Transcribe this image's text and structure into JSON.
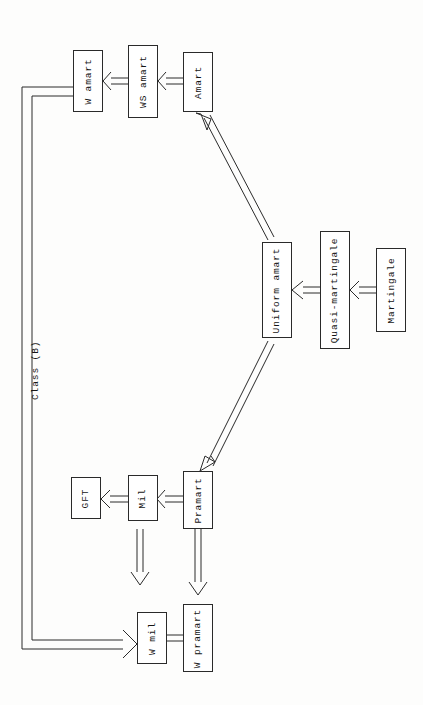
{
  "figure": {
    "orientation": "rotated-90-ccw",
    "stroke_color": "#2a2a2a",
    "background_color": "#fdfdfc"
  },
  "nodes": [
    {
      "id": "w-amart",
      "label": "W amart"
    },
    {
      "id": "ws-amart",
      "label": "WS amart"
    },
    {
      "id": "amart",
      "label": "Amart"
    },
    {
      "id": "uniform-amart",
      "label": "Uniform amart"
    },
    {
      "id": "quasi-martingale",
      "label": "Quasi-martingale"
    },
    {
      "id": "martingale",
      "label": "Martingale"
    },
    {
      "id": "gft",
      "label": "GFT"
    },
    {
      "id": "mil",
      "label": "Mil"
    },
    {
      "id": "pramart",
      "label": "Pramart"
    },
    {
      "id": "w-mil",
      "label": "W mil"
    },
    {
      "id": "w-pramart",
      "label": "W pramart"
    }
  ],
  "annotations": [
    {
      "id": "class-b",
      "label": "Class (B)"
    }
  ],
  "edges": [
    {
      "from": "ws-amart",
      "to": "w-amart"
    },
    {
      "from": "amart",
      "to": "ws-amart"
    },
    {
      "from": "uniform-amart",
      "to": "amart"
    },
    {
      "from": "quasi-martingale",
      "to": "uniform-amart"
    },
    {
      "from": "martingale",
      "to": "quasi-martingale"
    },
    {
      "from": "uniform-amart",
      "to": "pramart"
    },
    {
      "from": "mil",
      "to": "gft"
    },
    {
      "from": "pramart",
      "to": "mil"
    },
    {
      "from": "mil",
      "to": "w-mil"
    },
    {
      "from": "pramart",
      "to": "w-pramart"
    },
    {
      "from": "w-pramart",
      "to": "w-mil"
    },
    {
      "from": "w-amart",
      "to": "w-mil",
      "label": "Class (B)"
    }
  ]
}
